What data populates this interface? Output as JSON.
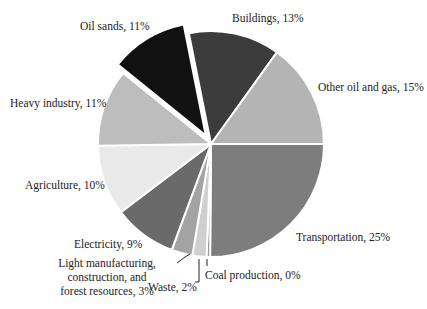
{
  "chart_data": {
    "type": "pie",
    "title": "",
    "center": [
      211,
      144
    ],
    "radius": 113,
    "start_angle_deg": 90,
    "direction": "clockwise",
    "slices": [
      {
        "label": "Transportation",
        "value": 25,
        "pct_label": "Transportation, 25%",
        "color": "#7d7d7d",
        "explode": 0
      },
      {
        "label": "Coal production",
        "value": 0.5,
        "pct_label": "Coal production, 0%",
        "color": "#9a9a9a",
        "explode": 0
      },
      {
        "label": "Waste",
        "value": 2,
        "pct_label": "Waste, 2%",
        "color": "#cfcfcf",
        "explode": 0
      },
      {
        "label": "Light manufacturing, construction, and forest resources",
        "value": 3,
        "pct_label": "Light manufacturing, construction, and forest resources, 3%",
        "color": "#a3a3a3",
        "explode": 0
      },
      {
        "label": "Electricity",
        "value": 9,
        "pct_label": "Electricity, 9%",
        "color": "#6a6a6a",
        "explode": 0
      },
      {
        "label": "Agriculture",
        "value": 10,
        "pct_label": "Agriculture, 10%",
        "color": "#e9e9e9",
        "explode": 0
      },
      {
        "label": "Heavy industry",
        "value": 11,
        "pct_label": "Heavy industry, 11%",
        "color": "#bdbdbd",
        "explode": 0
      },
      {
        "label": "Oil sands",
        "value": 11,
        "pct_label": "Oil sands, 11%",
        "color": "#111111",
        "explode": 10
      },
      {
        "label": "Buildings",
        "value": 13,
        "pct_label": "Buildings, 13%",
        "color": "#3c3c3c",
        "explode": 0
      },
      {
        "label": "Other oil and gas",
        "value": 15,
        "pct_label": "Other oil and gas, 15%",
        "color": "#b4b4b4",
        "explode": 0
      }
    ]
  },
  "labels": {
    "oil_sands": "Oil sands, 11%",
    "buildings": "Buildings, 13%",
    "other_oil_gas": "Other oil and gas, 15%",
    "heavy_industry": "Heavy industry, 11%",
    "agriculture": "Agriculture, 10%",
    "electricity": "Electricity, 9%",
    "light_mfg": "Light manufacturing, construction, and forest resources, 3%",
    "waste": "Waste, 2%",
    "coal": "Coal production, 0%",
    "transportation": "Transportation, 25%"
  }
}
